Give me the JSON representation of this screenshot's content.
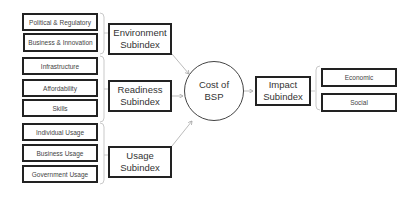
{
  "diagram": {
    "groups": [
      {
        "subindex": [
          "Environment",
          "Subindex"
        ],
        "items": [
          "Political & Regulatory",
          "Business & Innovation"
        ]
      },
      {
        "subindex": [
          "Readiness",
          "Subindex"
        ],
        "items": [
          "Infrastructure",
          "Affordability",
          "Skills"
        ]
      },
      {
        "subindex": [
          "Usage",
          "Subindex"
        ],
        "items": [
          "Individual Usage",
          "Business Usage",
          "Government Usage"
        ]
      }
    ],
    "center": [
      "Cost of",
      "BSP"
    ],
    "impact": {
      "subindex": [
        "Impact",
        "Subindex"
      ],
      "items": [
        "Economic",
        "Social"
      ]
    }
  }
}
